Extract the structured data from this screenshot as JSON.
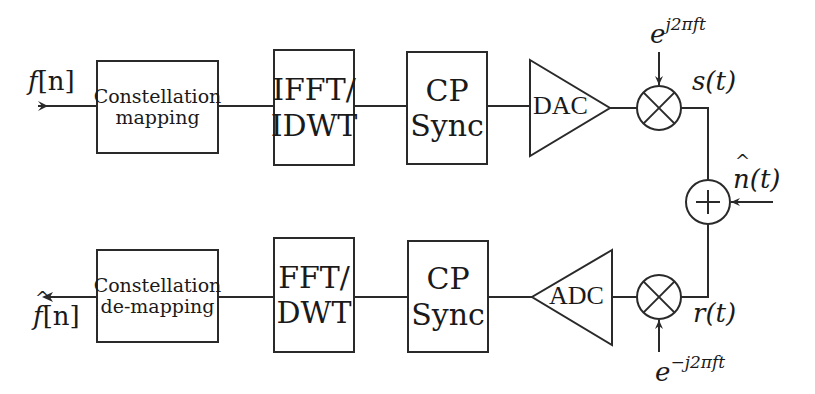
{
  "diagram": {
    "type": "block-diagram",
    "colors": {
      "stroke": "#2a2a2a",
      "background": "#ffffff",
      "text": "#1a1a1a"
    },
    "transmitter": {
      "input_label_base": "f",
      "input_label_index": "[n]",
      "blocks": [
        {
          "id": "constellation-mapping",
          "line1": "Constellation",
          "line2": "mapping"
        },
        {
          "id": "ifft-idwt",
          "line1": "IFFT/",
          "line2": "IDWT"
        },
        {
          "id": "cp-sync-tx",
          "line1": "CP",
          "line2": "Sync"
        }
      ],
      "converter": "DAC",
      "mixer_input": {
        "base": "e",
        "exponent": "j2πft"
      },
      "output_signal": "s(t)"
    },
    "channel": {
      "adder": "+",
      "noise_label_base": "n",
      "noise_label_arg": "(t)"
    },
    "receiver": {
      "output_label_base": "f",
      "output_label_index": "[n]",
      "blocks": [
        {
          "id": "constellation-demapping",
          "line1": "Constellation",
          "line2": "de-mapping"
        },
        {
          "id": "fft-dwt",
          "line1": "FFT/",
          "line2": "DWT"
        },
        {
          "id": "cp-sync-rx",
          "line1": "CP",
          "line2": "Sync"
        }
      ],
      "converter": "ADC",
      "mixer_input": {
        "base": "e",
        "exponent": "−j2πft"
      },
      "input_signal": "r(t)"
    }
  }
}
